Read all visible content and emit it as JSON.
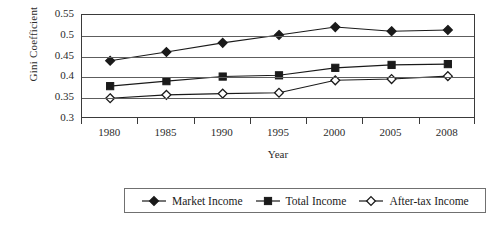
{
  "chart_data": {
    "type": "line",
    "title": "",
    "xlabel": "Year",
    "ylabel": "Gini Coefficient",
    "categories": [
      "1980",
      "1985",
      "1990",
      "1995",
      "2000",
      "2005",
      "2008"
    ],
    "x": [
      1980,
      1985,
      1990,
      1995,
      2000,
      2005,
      2008
    ],
    "ylim": [
      0.3,
      0.55
    ],
    "yticks": [
      0.3,
      0.35,
      0.4,
      0.45,
      0.5,
      0.55
    ],
    "ytick_labels": [
      "0.3",
      "0.35",
      "0.4",
      "0.45",
      "0.5",
      "0.55"
    ],
    "grid": true,
    "legend_position": "bottom",
    "series": [
      {
        "name": "Market Income",
        "marker": "filled-diamond",
        "values": [
          0.44,
          0.461,
          0.483,
          0.502,
          0.521,
          0.511,
          0.514
        ]
      },
      {
        "name": "Total Income",
        "marker": "filled-square",
        "values": [
          0.379,
          0.391,
          0.402,
          0.405,
          0.423,
          0.43,
          0.432
        ]
      },
      {
        "name": "After-tax Income",
        "marker": "open-diamond",
        "values": [
          0.35,
          0.358,
          0.361,
          0.363,
          0.393,
          0.396,
          0.403
        ]
      }
    ]
  },
  "colors": {
    "series_line": "#1a1a1a",
    "marker_fill": "#1a1a1a",
    "marker_open_fill": "#ffffff",
    "gridline": "#5d5d5d",
    "frame": "#3a3a3a",
    "text": "#2b2b2b",
    "background": "#ffffff"
  },
  "axes": {
    "y_title": "Gini Coefficient",
    "x_title": "Year"
  },
  "legend": {
    "items": [
      {
        "label": "Market Income",
        "marker": "filled-diamond"
      },
      {
        "label": "Total Income",
        "marker": "filled-square"
      },
      {
        "label": "After-tax Income",
        "marker": "open-diamond"
      }
    ]
  }
}
